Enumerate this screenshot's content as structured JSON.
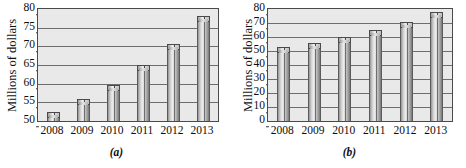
{
  "figure": {
    "width": 466,
    "height": 168,
    "background": "#ffffff",
    "panel_count": 2
  },
  "colors": {
    "plot_background": "#e9e9e9",
    "gridline": "#6d6d6d",
    "axis_frame": "#4a4a4a",
    "bar_outline": "#5a5a5a",
    "bar_light": "#ececec",
    "bar_dark": "#7b7b7b",
    "text": "#0d0d0d"
  },
  "panels": [
    {
      "id": "a",
      "caption": "(a)",
      "ylabel": "Millions of dollars",
      "yticks": [
        "50",
        "55",
        "60",
        "65",
        "70",
        "75",
        "80"
      ],
      "xticks": [
        "2008",
        "2009",
        "2010",
        "2011",
        "2012",
        "2013"
      ]
    },
    {
      "id": "b",
      "caption": "(b)",
      "ylabel": "Millions of dollars",
      "yticks": [
        "0",
        "10",
        "20",
        "30",
        "40",
        "50",
        "60",
        "70",
        "80"
      ],
      "xticks": [
        "2008",
        "2009",
        "2010",
        "2011",
        "2012",
        "2013"
      ]
    }
  ],
  "chart_data": [
    {
      "type": "bar",
      "panel": "(a)",
      "title": "",
      "xlabel": "",
      "ylabel": "Millions of dollars",
      "categories": [
        "2008",
        "2009",
        "2010",
        "2011",
        "2012",
        "2013"
      ],
      "values": [
        52.5,
        55.8,
        59.7,
        65.0,
        70.5,
        78.0
      ],
      "ylim": [
        50,
        80
      ],
      "ytick_values": [
        50,
        55,
        60,
        65,
        70,
        75,
        80
      ],
      "grid": true,
      "legend": false,
      "note": "Truncated y-axis beginning at 50 exaggerates growth"
    },
    {
      "type": "bar",
      "panel": "(b)",
      "title": "",
      "xlabel": "",
      "ylabel": "Millions of dollars",
      "categories": [
        "2008",
        "2009",
        "2010",
        "2011",
        "2012",
        "2013"
      ],
      "values": [
        52.5,
        55.8,
        59.7,
        65.0,
        70.5,
        78.0
      ],
      "ylim": [
        0,
        80
      ],
      "ytick_values": [
        0,
        10,
        20,
        30,
        40,
        50,
        60,
        70,
        80
      ],
      "grid": true,
      "legend": false,
      "note": "Full y-axis beginning at 0 shows true proportion"
    }
  ]
}
